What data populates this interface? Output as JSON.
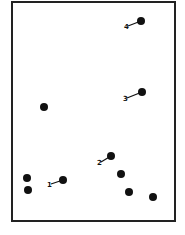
{
  "diagram": {
    "frame": {
      "x": 12,
      "y": 2,
      "width": 163,
      "height": 219,
      "stroke": "#222222"
    },
    "dot_color": "#111111",
    "dots": [
      {
        "id": "dot-4",
        "cx": 141,
        "cy": 21,
        "label": "4",
        "label_x": 124,
        "label_y": 29
      },
      {
        "id": "dot-3",
        "cx": 142,
        "cy": 92,
        "label": "3",
        "label_x": 123,
        "label_y": 101
      },
      {
        "id": "dot-a",
        "cx": 44,
        "cy": 107
      },
      {
        "id": "dot-2",
        "cx": 111,
        "cy": 156,
        "label": "2",
        "label_x": 97,
        "label_y": 165
      },
      {
        "id": "dot-b",
        "cx": 27,
        "cy": 178
      },
      {
        "id": "dot-c",
        "cx": 28,
        "cy": 190
      },
      {
        "id": "dot-1",
        "cx": 63,
        "cy": 180,
        "label": "1",
        "label_x": 47,
        "label_y": 187
      },
      {
        "id": "dot-d",
        "cx": 121,
        "cy": 174
      },
      {
        "id": "dot-e",
        "cx": 129,
        "cy": 192
      },
      {
        "id": "dot-f",
        "cx": 153,
        "cy": 197
      }
    ]
  }
}
